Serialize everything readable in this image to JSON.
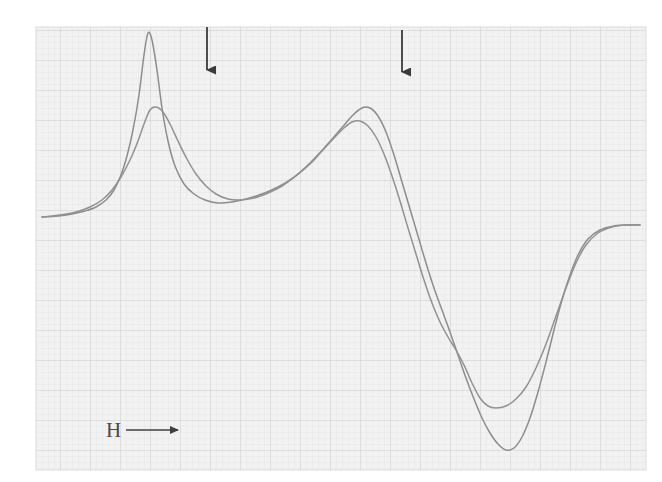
{
  "figure": {
    "kind": "scanned-spectrum-on-graph-paper",
    "caption_visible": false,
    "axis_label": "H",
    "axis_label_arrow": "→",
    "background_color": "#ffffff",
    "paper_color": "#f2f2f2",
    "grid_minor_color": "#e0e0e0",
    "grid_major_color": "#cfcfcf",
    "curve_color": "#8a8a8a",
    "curve_color_dark": "#6f6f6f",
    "marker_color": "#3a3a3a"
  },
  "paper": {
    "left": 36,
    "top": 27,
    "right": 646,
    "bottom": 470,
    "minor_spacing": 6,
    "major_spacing": 30
  },
  "markers": [
    {
      "name": "field-marker-1",
      "glyph": "↓",
      "x": 207,
      "y_top": 27,
      "y_bottom": 79
    },
    {
      "name": "field-marker-2",
      "glyph": "↓",
      "x": 402,
      "y_top": 30,
      "y_bottom": 81
    }
  ],
  "axis_label_position": {
    "x": 106,
    "y": 437,
    "arrow_x1": 126,
    "arrow_x2": 180
  },
  "chart_data": {
    "type": "line",
    "title": "",
    "subtitle": "",
    "xlabel": "H",
    "ylabel": "",
    "grid": true,
    "legend_position": "none",
    "axis_ranges": {
      "x_pixels": [
        36,
        646
      ],
      "y_pixels": [
        27,
        470
      ]
    },
    "annotations": [
      {
        "text": "H →",
        "x": 106,
        "y": 437
      },
      {
        "text": "↓",
        "x": 207,
        "y": 79
      },
      {
        "text": "↓",
        "x": 402,
        "y": 81
      }
    ],
    "series": [
      {
        "name": "sharp-trace",
        "description": "narrow, high-amplitude derivative trace",
        "points": [
          [
            42,
            217
          ],
          [
            58,
            216
          ],
          [
            72,
            214
          ],
          [
            85,
            211
          ],
          [
            96,
            207
          ],
          [
            106,
            200
          ],
          [
            114,
            190
          ],
          [
            121,
            175
          ],
          [
            127,
            156
          ],
          [
            133,
            130
          ],
          [
            139,
            95
          ],
          [
            144,
            55
          ],
          [
            148,
            33
          ],
          [
            152,
            40
          ],
          [
            157,
            70
          ],
          [
            162,
            108
          ],
          [
            168,
            141
          ],
          [
            175,
            166
          ],
          [
            184,
            184
          ],
          [
            194,
            194
          ],
          [
            205,
            200
          ],
          [
            218,
            203
          ],
          [
            232,
            202
          ],
          [
            246,
            199
          ],
          [
            262,
            194
          ],
          [
            278,
            187
          ],
          [
            294,
            177
          ],
          [
            310,
            163
          ],
          [
            326,
            146
          ],
          [
            340,
            130
          ],
          [
            352,
            116
          ],
          [
            362,
            108
          ],
          [
            370,
            108
          ],
          [
            378,
            116
          ],
          [
            386,
            132
          ],
          [
            394,
            155
          ],
          [
            402,
            182
          ],
          [
            410,
            209
          ],
          [
            418,
            236
          ],
          [
            426,
            263
          ],
          [
            434,
            288
          ],
          [
            442,
            310
          ],
          [
            450,
            332
          ],
          [
            458,
            355
          ],
          [
            466,
            378
          ],
          [
            474,
            399
          ],
          [
            482,
            418
          ],
          [
            490,
            433
          ],
          [
            498,
            444
          ],
          [
            506,
            450
          ],
          [
            514,
            448
          ],
          [
            522,
            437
          ],
          [
            530,
            418
          ],
          [
            538,
            392
          ],
          [
            546,
            362
          ],
          [
            554,
            330
          ],
          [
            562,
            300
          ],
          [
            570,
            275
          ],
          [
            578,
            255
          ],
          [
            588,
            239
          ],
          [
            600,
            230
          ],
          [
            614,
            226
          ],
          [
            628,
            225
          ],
          [
            640,
            225
          ]
        ]
      },
      {
        "name": "broad-trace",
        "description": "broader, lower-amplitude derivative trace",
        "points": [
          [
            42,
            217
          ],
          [
            60,
            215
          ],
          [
            76,
            212
          ],
          [
            90,
            207
          ],
          [
            102,
            200
          ],
          [
            112,
            190
          ],
          [
            121,
            177
          ],
          [
            130,
            160
          ],
          [
            138,
            141
          ],
          [
            144,
            124
          ],
          [
            150,
            110
          ],
          [
            156,
            107
          ],
          [
            163,
            112
          ],
          [
            170,
            124
          ],
          [
            178,
            141
          ],
          [
            187,
            159
          ],
          [
            196,
            174
          ],
          [
            206,
            186
          ],
          [
            216,
            194
          ],
          [
            228,
            199
          ],
          [
            240,
            200
          ],
          [
            254,
            198
          ],
          [
            268,
            193
          ],
          [
            282,
            186
          ],
          [
            296,
            176
          ],
          [
            310,
            164
          ],
          [
            322,
            151
          ],
          [
            334,
            138
          ],
          [
            344,
            128
          ],
          [
            352,
            122
          ],
          [
            360,
            121
          ],
          [
            368,
            126
          ],
          [
            376,
            137
          ],
          [
            384,
            154
          ],
          [
            392,
            176
          ],
          [
            400,
            201
          ],
          [
            408,
            228
          ],
          [
            416,
            254
          ],
          [
            424,
            280
          ],
          [
            432,
            303
          ],
          [
            440,
            322
          ],
          [
            448,
            337
          ],
          [
            456,
            350
          ],
          [
            464,
            365
          ],
          [
            472,
            383
          ],
          [
            480,
            398
          ],
          [
            488,
            406
          ],
          [
            496,
            408
          ],
          [
            506,
            406
          ],
          [
            516,
            399
          ],
          [
            526,
            387
          ],
          [
            536,
            368
          ],
          [
            546,
            344
          ],
          [
            556,
            316
          ],
          [
            566,
            288
          ],
          [
            576,
            263
          ],
          [
            586,
            245
          ],
          [
            598,
            233
          ],
          [
            612,
            227
          ],
          [
            626,
            225
          ],
          [
            640,
            225
          ]
        ]
      }
    ]
  }
}
